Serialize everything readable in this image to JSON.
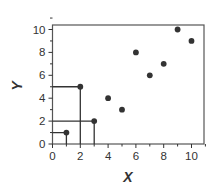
{
  "chart_data": {
    "type": "scatter",
    "title": "",
    "xlabel": "X",
    "ylabel": "Y",
    "xlim": [
      0,
      11
    ],
    "ylim": [
      0,
      11
    ],
    "x_ticks": [
      0,
      2,
      4,
      6,
      8,
      10
    ],
    "y_ticks": [
      0,
      2,
      4,
      6,
      8,
      10
    ],
    "x_tick_labels": [
      "0",
      "2",
      "4",
      "6",
      "8",
      "10"
    ],
    "y_tick_labels": [
      "0",
      "2",
      "4",
      "6",
      "8",
      "10"
    ],
    "minor_ticks": true,
    "grid": false,
    "legend": null,
    "series": [
      {
        "name": "points",
        "x": [
          1,
          2,
          3,
          4,
          5,
          6,
          7,
          8,
          9,
          10
        ],
        "y": [
          1,
          5,
          2,
          4,
          3,
          8,
          6,
          7,
          10,
          9
        ]
      }
    ],
    "annotations": [
      {
        "type": "drop-lines",
        "point": [
          1,
          1
        ]
      },
      {
        "type": "drop-lines",
        "point": [
          2,
          5
        ]
      },
      {
        "type": "drop-lines",
        "point": [
          3,
          2
        ]
      }
    ]
  },
  "colors": {
    "ink": "#333333",
    "frame": "#555555"
  }
}
